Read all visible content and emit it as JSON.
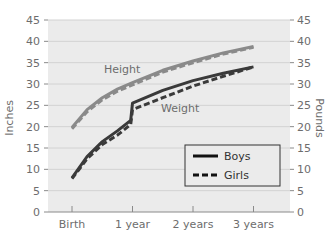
{
  "chart_data": {
    "type": "line",
    "title": "",
    "xlabel": "",
    "ylabel_left": "Inches",
    "ylabel_right": "Pounds",
    "categories": [
      "Birth",
      "1 year",
      "2 years",
      "3 years"
    ],
    "x": [
      0,
      0.25,
      0.5,
      0.75,
      0.97,
      1,
      1.5,
      2,
      2.5,
      3
    ],
    "ylim": [
      0,
      45
    ],
    "yticks": [
      0,
      5,
      10,
      15,
      20,
      25,
      30,
      35,
      40,
      45
    ],
    "grid": true,
    "legend_position": "lower right",
    "series": [
      {
        "name": "Height - Boys",
        "group": "Height",
        "style": "solid",
        "color": "#8a8a8a",
        "x": [
          0,
          0.25,
          0.5,
          0.75,
          1,
          1.5,
          2,
          2.5,
          3
        ],
        "values": [
          19.8,
          24.0,
          26.8,
          28.8,
          30.3,
          33.2,
          35.4,
          37.3,
          38.8
        ]
      },
      {
        "name": "Height - Girls",
        "group": "Height",
        "style": "dashed",
        "color": "#8a8a8a",
        "x": [
          0,
          0.25,
          0.5,
          0.75,
          1,
          1.5,
          2,
          2.5,
          3
        ],
        "values": [
          19.5,
          23.5,
          26.3,
          28.3,
          29.8,
          32.8,
          35.0,
          37.0,
          38.6
        ]
      },
      {
        "name": "Weight - Boys",
        "group": "Weight",
        "style": "solid",
        "color": "#3a3a3a",
        "x": [
          0,
          0.25,
          0.5,
          0.75,
          0.97,
          1,
          1.5,
          2,
          2.5,
          3
        ],
        "values": [
          8.0,
          13.0,
          16.5,
          19.0,
          21.5,
          25.5,
          28.5,
          30.8,
          32.5,
          34.0
        ]
      },
      {
        "name": "Weight - Girls",
        "group": "Weight",
        "style": "dashed",
        "color": "#3a3a3a",
        "x": [
          0,
          0.25,
          0.5,
          0.75,
          0.97,
          1,
          1.5,
          2,
          2.5,
          3
        ],
        "values": [
          7.8,
          12.5,
          15.8,
          18.0,
          20.5,
          24.0,
          26.8,
          29.5,
          31.8,
          34.0
        ]
      }
    ],
    "annotations": [
      {
        "text": "Height",
        "x": 0.6,
        "y": 32.5
      },
      {
        "text": "Weight",
        "x": 1.5,
        "y": 25.0
      }
    ],
    "legend": [
      {
        "label": "Boys",
        "style": "solid"
      },
      {
        "label": "Girls",
        "style": "dashed"
      }
    ]
  }
}
